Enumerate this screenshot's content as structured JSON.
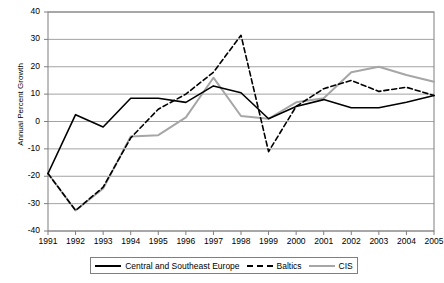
{
  "chart_data": {
    "type": "line",
    "title": "",
    "xlabel": "",
    "ylabel": "Annual Percent Growth",
    "x": [
      1991,
      1992,
      1993,
      1994,
      1995,
      1996,
      1997,
      1998,
      1999,
      2000,
      2001,
      2002,
      2003,
      2004,
      2005
    ],
    "xticklabels": [
      "1991",
      "1992",
      "1993",
      "1994",
      "1995",
      "1996",
      "1997",
      "1998",
      "1999",
      "2000",
      "2001",
      "2002",
      "2003",
      "2004",
      "2005"
    ],
    "yticklabels": [
      "-40",
      "-30",
      "-20",
      "-10",
      "0",
      "10",
      "20",
      "30",
      "40"
    ],
    "ylim": [
      -40,
      40
    ],
    "ytick_step": 10,
    "grid": "horizontal",
    "legend_position": "bottom",
    "series": [
      {
        "name": "Central and Southeast Europe",
        "style": "solid",
        "color": "#000000",
        "values": [
          -19,
          2.5,
          -2,
          8.5,
          8.5,
          7,
          13,
          10.5,
          1,
          5.5,
          8,
          5,
          5,
          7,
          9.5
        ]
      },
      {
        "name": "Baltics",
        "style": "dashed",
        "color": "#000000",
        "values": [
          -19,
          -32.5,
          -24,
          -6,
          4.5,
          10,
          18,
          31.5,
          -11,
          5.5,
          12,
          15,
          11,
          12.5,
          9.5
        ]
      },
      {
        "name": "CIS",
        "style": "solid",
        "color": "#a6a6a6",
        "values": [
          -19,
          -32.5,
          -24.5,
          -5.5,
          -5,
          1.5,
          16,
          2,
          1,
          7,
          8.5,
          18,
          20,
          17,
          14.5
        ]
      }
    ]
  },
  "legend": {
    "items": [
      {
        "label": "Central and Southeast Europe",
        "style": "solid",
        "color": "#000000"
      },
      {
        "label": "Baltics",
        "style": "dashed",
        "color": "#000000"
      },
      {
        "label": "CIS",
        "style": "solid",
        "color": "#a6a6a6"
      }
    ]
  }
}
